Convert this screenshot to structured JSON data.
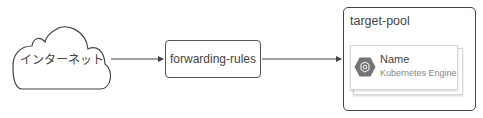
{
  "diagram": {
    "nodes": {
      "internet": {
        "label": "インターネット",
        "shape": "cloud"
      },
      "forwarding_rules": {
        "label": "forwarding-rules",
        "shape": "rounded-rect"
      },
      "target_pool": {
        "label": "target-pool",
        "shape": "container",
        "card": {
          "name": "Name",
          "service": "Kubernetes Engine",
          "icon": "kubernetes-engine-hexagon-icon"
        }
      }
    },
    "edges": [
      {
        "from": "internet",
        "to": "forwarding_rules",
        "arrow": "end"
      },
      {
        "from": "forwarding_rules",
        "to": "target_pool",
        "arrow": "end"
      }
    ],
    "colors": {
      "stroke": "#444444",
      "icon_fill": "#757575",
      "card_border": "#d8d8d8",
      "subtext": "#888888"
    }
  }
}
